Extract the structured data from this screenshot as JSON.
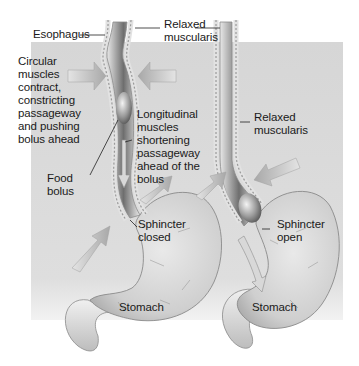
{
  "figure": {
    "panels": [
      {
        "id": "left",
        "state": "sphincter-closed",
        "labels": {
          "esophagus": "Esophagus",
          "relaxed_top": "Relaxed\nmuscularis",
          "circular": "Circular\nmuscles\ncontract,\nconstricting\npassageway\nand pushing\nbolus ahead",
          "longitudinal": "Longitudinal\nmuscles\nshortening\npassageway\nahead of the\nbolus",
          "food_bolus": "Food\nbolus",
          "sphincter": "Sphincter\nclosed",
          "stomach": "Stomach"
        }
      },
      {
        "id": "right",
        "state": "sphincter-open",
        "labels": {
          "relaxed": "Relaxed\nmuscularis",
          "sphincter": "Sphincter\nopen",
          "stomach": "Stomach"
        }
      }
    ],
    "colors": {
      "panel_background": "#d9d9d9",
      "tissue": "#c9c9c9",
      "tissue_dark": "#7a7a7a",
      "arrow": "#bdbdbd",
      "text": "#1a1a1a"
    }
  }
}
